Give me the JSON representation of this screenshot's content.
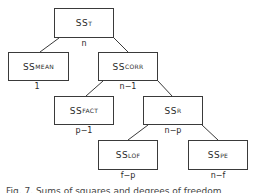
{
  "diagram": {
    "type": "tree",
    "nodes": [
      {
        "id": "ss_t",
        "label": "SS",
        "subscript": "T",
        "df": "n",
        "box": [
          54,
          8,
          60,
          30
        ]
      },
      {
        "id": "ss_mean",
        "label": "SS",
        "subscript": "MEAN",
        "df": "1",
        "box": [
          8,
          52,
          61,
          29
        ]
      },
      {
        "id": "ss_corr",
        "label": "SS",
        "subscript": "CORR",
        "df": "n−1",
        "box": [
          98,
          52,
          60,
          29
        ]
      },
      {
        "id": "ss_fact",
        "label": "SS",
        "subscript": "FACT",
        "df": "p−1",
        "box": [
          54,
          96,
          60,
          29
        ]
      },
      {
        "id": "ss_r",
        "label": "SS",
        "subscript": "R",
        "df": "n−p",
        "box": [
          143,
          96,
          60,
          29
        ]
      },
      {
        "id": "ss_lof",
        "label": "SS",
        "subscript": "LOF",
        "df": "f−p",
        "box": [
          98,
          140,
          60,
          30
        ]
      },
      {
        "id": "ss_pe",
        "label": "SS",
        "subscript": "PE",
        "df": "n−f",
        "box": [
          188,
          140,
          60,
          30
        ]
      }
    ],
    "edges": [
      {
        "from": "ss_t",
        "to": "ss_mean"
      },
      {
        "from": "ss_t",
        "to": "ss_corr"
      },
      {
        "from": "ss_corr",
        "to": "ss_fact"
      },
      {
        "from": "ss_corr",
        "to": "ss_r"
      },
      {
        "from": "ss_r",
        "to": "ss_lof"
      },
      {
        "from": "ss_r",
        "to": "ss_pe"
      }
    ]
  },
  "caption": "Fig. 7. Sums of squares and degrees of freedom"
}
